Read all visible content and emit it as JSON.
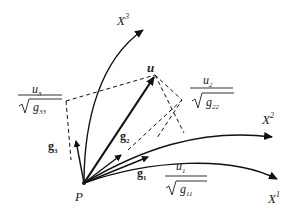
{
  "figure": {
    "type": "curvilinear coordinate vector decomposition",
    "origin_label": "P",
    "vector_label": "u",
    "axes": [
      {
        "name": "X",
        "sup": "1"
      },
      {
        "name": "X",
        "sup": "2"
      },
      {
        "name": "X",
        "sup": "3"
      }
    ],
    "base_vectors": [
      {
        "name": "g",
        "sub": "1"
      },
      {
        "name": "g",
        "sub": "2"
      },
      {
        "name": "g",
        "sub": "3"
      }
    ],
    "components": [
      {
        "num": "u",
        "num_sub": "1",
        "den": "g",
        "den_sub": "11"
      },
      {
        "num": "u",
        "num_sub": "2",
        "den": "g",
        "den_sub": "22"
      },
      {
        "num": "u",
        "num_sub": "3",
        "den": "g",
        "den_sub": "33"
      }
    ],
    "colors": {
      "stroke": "#111111",
      "text": "#222222",
      "background": "#ffffff"
    }
  }
}
